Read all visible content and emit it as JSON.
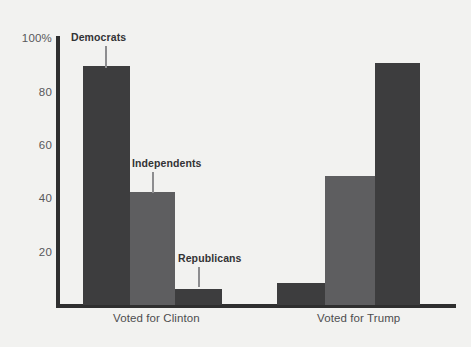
{
  "chart_data": {
    "type": "bar",
    "title": "",
    "xlabel": "",
    "ylabel": "",
    "ylim": [
      0,
      100
    ],
    "grid": false,
    "legend_position": "none",
    "categories": [
      "Voted for Clinton",
      "Voted for Trump"
    ],
    "series": [
      {
        "name": "Democrats",
        "values": [
          89,
          8
        ]
      },
      {
        "name": "Independents",
        "values": [
          42,
          48
        ]
      },
      {
        "name": "Republicans",
        "values": [
          6,
          90
        ]
      }
    ],
    "ytick_labels": [
      "100%",
      "80",
      "60",
      "40",
      "20"
    ],
    "ytick_values": [
      100,
      80,
      60,
      40,
      20
    ],
    "annotations": [
      {
        "text": "Democrats",
        "group": "Voted for Clinton"
      },
      {
        "text": "Independents",
        "group": "Voted for Clinton"
      },
      {
        "text": "Republicans",
        "group": "Voted for Clinton"
      }
    ],
    "colors": {
      "democrats": "#3d3d3e",
      "independents": "#5e5e60",
      "republicans": "#3d3d3e",
      "axis": "#2f2f2f",
      "background": "#f2f2f0",
      "label_text": "#333335",
      "tick_text": "#58585a"
    }
  }
}
